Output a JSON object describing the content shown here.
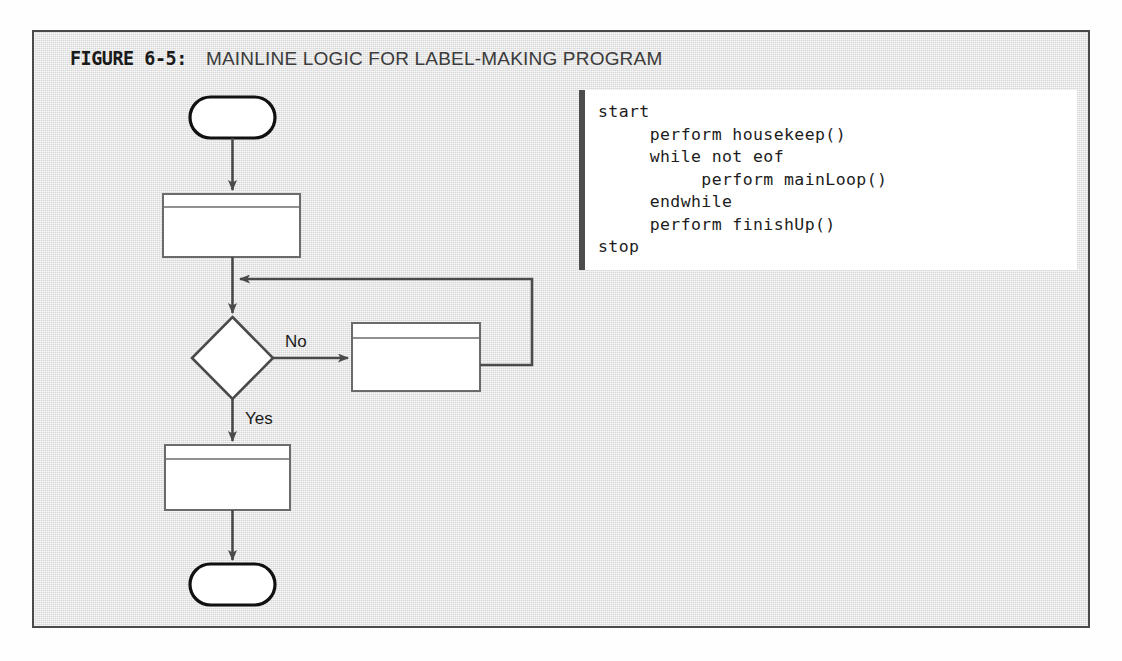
{
  "figure": {
    "number": "FIGURE 6-5:",
    "title": "MAINLINE LOGIC FOR LABEL-MAKING PROGRAM",
    "frame_color": "#4a4a4a",
    "panel_color": "#e5e5e5"
  },
  "code_panel": {
    "accent_color": "#4c4c4c",
    "background": "#ffffff",
    "lines": [
      "start",
      "     perform housekeep()",
      "     while not eof",
      "          perform mainLoop()",
      "     endwhile",
      "     perform finishUp()",
      "stop"
    ],
    "text": "start\n     perform housekeep()\n     while not eof\n          perform mainLoop()\n     endwhile\n     perform finishUp()\nstop"
  },
  "flowchart": {
    "type": "flowchart",
    "nodes": [
      {
        "id": "start",
        "shape": "terminator",
        "label": "start"
      },
      {
        "id": "housekeep",
        "shape": "predefined-process",
        "label": "housekeep()"
      },
      {
        "id": "eof",
        "shape": "decision",
        "label": "eof?"
      },
      {
        "id": "mainLoop",
        "shape": "predefined-process",
        "label": "mainLoop()"
      },
      {
        "id": "finishUp",
        "shape": "predefined-process",
        "label": "finishUp()"
      },
      {
        "id": "stop",
        "shape": "terminator",
        "label": "stop"
      }
    ],
    "edges": [
      {
        "from": "start",
        "to": "housekeep",
        "label": ""
      },
      {
        "from": "housekeep",
        "to": "eof",
        "label": ""
      },
      {
        "from": "eof",
        "to": "mainLoop",
        "label": "No"
      },
      {
        "from": "mainLoop",
        "to": "eof",
        "label": ""
      },
      {
        "from": "eof",
        "to": "finishUp",
        "label": "Yes"
      },
      {
        "from": "finishUp",
        "to": "stop",
        "label": ""
      }
    ],
    "edge_labels": {
      "no": "No",
      "yes": "Yes"
    },
    "line_color": "#4a4a4a",
    "node_fill": "#ffffff"
  }
}
